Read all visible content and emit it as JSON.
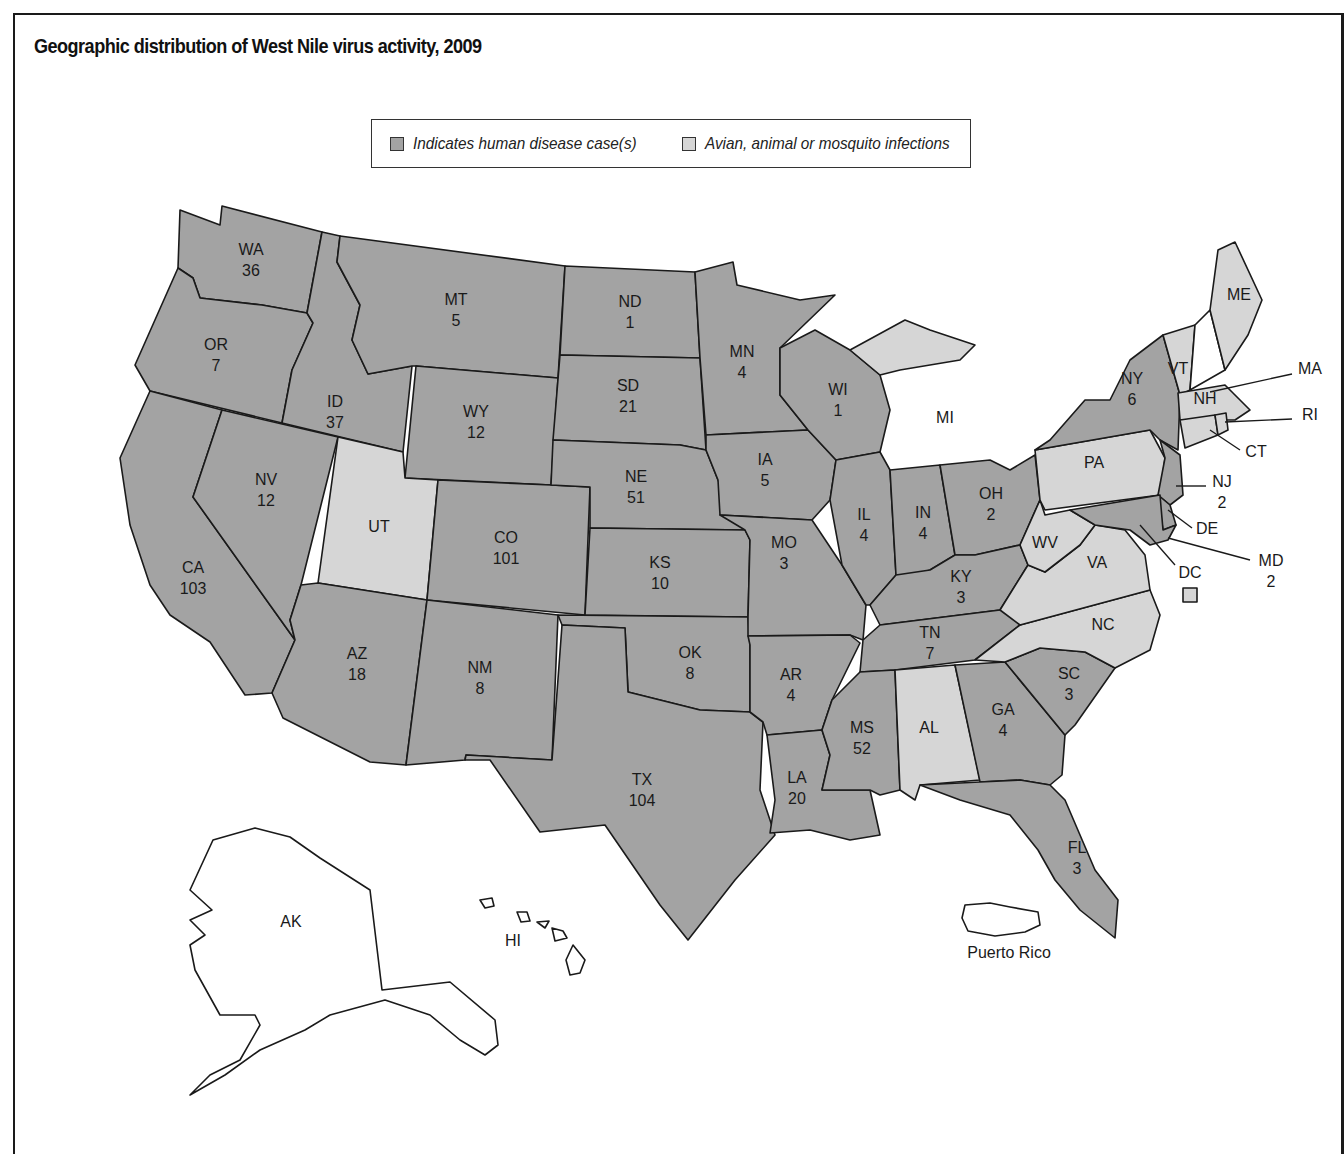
{
  "title": "Geographic distribution of West Nile virus activity, 2009",
  "legend": {
    "human": {
      "label": "Indicates human disease case(s)",
      "color": "#a3a3a3"
    },
    "avian": {
      "label": "Avian, animal or mosquito infections",
      "color": "#d6d6d6"
    }
  },
  "colors": {
    "human": "#a3a3a3",
    "avian": "#d6d6d6",
    "none": "#ffffff",
    "outline": "#1a1a1a"
  },
  "states": {
    "WA": {
      "abbr": "WA",
      "category": "human",
      "cases": "36"
    },
    "OR": {
      "abbr": "OR",
      "category": "human",
      "cases": "7"
    },
    "CA": {
      "abbr": "CA",
      "category": "human",
      "cases": "103"
    },
    "ID": {
      "abbr": "ID",
      "category": "human",
      "cases": "37"
    },
    "NV": {
      "abbr": "NV",
      "category": "human",
      "cases": "12"
    },
    "MT": {
      "abbr": "MT",
      "category": "human",
      "cases": "5"
    },
    "WY": {
      "abbr": "WY",
      "category": "human",
      "cases": "12"
    },
    "UT": {
      "abbr": "UT",
      "category": "avian",
      "cases": ""
    },
    "CO": {
      "abbr": "CO",
      "category": "human",
      "cases": "101"
    },
    "AZ": {
      "abbr": "AZ",
      "category": "human",
      "cases": "18"
    },
    "NM": {
      "abbr": "NM",
      "category": "human",
      "cases": "8"
    },
    "ND": {
      "abbr": "ND",
      "category": "human",
      "cases": "1"
    },
    "SD": {
      "abbr": "SD",
      "category": "human",
      "cases": "21"
    },
    "NE": {
      "abbr": "NE",
      "category": "human",
      "cases": "51"
    },
    "KS": {
      "abbr": "KS",
      "category": "human",
      "cases": "10"
    },
    "OK": {
      "abbr": "OK",
      "category": "human",
      "cases": "8"
    },
    "TX": {
      "abbr": "TX",
      "category": "human",
      "cases": "104"
    },
    "MN": {
      "abbr": "MN",
      "category": "human",
      "cases": "4"
    },
    "IA": {
      "abbr": "IA",
      "category": "human",
      "cases": "5"
    },
    "MO": {
      "abbr": "MO",
      "category": "human",
      "cases": "3"
    },
    "AR": {
      "abbr": "AR",
      "category": "human",
      "cases": "4"
    },
    "LA": {
      "abbr": "LA",
      "category": "human",
      "cases": "20"
    },
    "WI": {
      "abbr": "WI",
      "category": "human",
      "cases": "1"
    },
    "IL": {
      "abbr": "IL",
      "category": "human",
      "cases": "4"
    },
    "MI": {
      "abbr": "MI",
      "category": "avian",
      "cases": ""
    },
    "IN": {
      "abbr": "IN",
      "category": "human",
      "cases": "4"
    },
    "OH": {
      "abbr": "OH",
      "category": "human",
      "cases": "2"
    },
    "KY": {
      "abbr": "KY",
      "category": "human",
      "cases": "3"
    },
    "TN": {
      "abbr": "TN",
      "category": "human",
      "cases": "7"
    },
    "MS": {
      "abbr": "MS",
      "category": "human",
      "cases": "52"
    },
    "AL": {
      "abbr": "AL",
      "category": "avian",
      "cases": ""
    },
    "GA": {
      "abbr": "GA",
      "category": "human",
      "cases": "4"
    },
    "FL": {
      "abbr": "FL",
      "category": "human",
      "cases": "3"
    },
    "SC": {
      "abbr": "SC",
      "category": "human",
      "cases": "3"
    },
    "NC": {
      "abbr": "NC",
      "category": "avian",
      "cases": ""
    },
    "VA": {
      "abbr": "VA",
      "category": "avian",
      "cases": ""
    },
    "WV": {
      "abbr": "WV",
      "category": "avian",
      "cases": ""
    },
    "PA": {
      "abbr": "PA",
      "category": "avian",
      "cases": ""
    },
    "NY": {
      "abbr": "NY",
      "category": "human",
      "cases": "6"
    },
    "NJ": {
      "abbr": "NJ",
      "category": "human",
      "cases": "2"
    },
    "DE": {
      "abbr": "DE",
      "category": "human",
      "cases": ""
    },
    "MD": {
      "abbr": "MD",
      "category": "human",
      "cases": "2"
    },
    "DC": {
      "abbr": "DC",
      "category": "avian",
      "cases": ""
    },
    "VT": {
      "abbr": "VT",
      "category": "avian",
      "cases": ""
    },
    "NH": {
      "abbr": "NH",
      "category": "none",
      "cases": ""
    },
    "ME": {
      "abbr": "ME",
      "category": "avian",
      "cases": ""
    },
    "MA": {
      "abbr": "MA",
      "category": "avian",
      "cases": ""
    },
    "RI": {
      "abbr": "RI",
      "category": "avian",
      "cases": ""
    },
    "CT": {
      "abbr": "CT",
      "category": "avian",
      "cases": ""
    },
    "AK": {
      "abbr": "AK",
      "category": "none",
      "cases": ""
    },
    "HI": {
      "abbr": "HI",
      "category": "none",
      "cases": ""
    }
  },
  "territories": {
    "PR": {
      "label": "Puerto Rico",
      "category": "none"
    }
  }
}
